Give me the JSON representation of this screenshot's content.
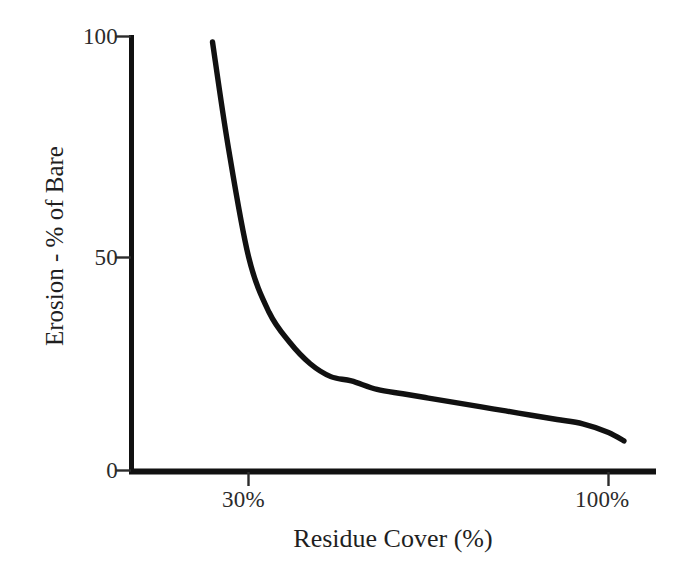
{
  "chart_data": {
    "type": "line",
    "title": "",
    "xlabel": "Residue Cover (%)",
    "ylabel": "Erosion - % of Bare",
    "xlim": [
      20,
      108
    ],
    "ylim": [
      0,
      100
    ],
    "grid": false,
    "legend": null,
    "x_tick_labels": [
      "30%",
      "100%"
    ],
    "x_tick_values": [
      30,
      100
    ],
    "y_tick_labels": [
      "0",
      "50",
      "100"
    ],
    "y_tick_values": [
      0,
      50,
      100
    ],
    "series": [
      {
        "name": "Erosion vs Residue Cover",
        "color": "#111111",
        "x": [
          23,
          26,
          30,
          34,
          38,
          42,
          46,
          50,
          55,
          60,
          65,
          70,
          75,
          80,
          85,
          90,
          95,
          100,
          103
        ],
        "values": [
          100,
          76,
          50,
          37,
          30,
          25,
          22,
          21,
          19,
          18,
          17,
          16,
          15,
          14,
          13,
          12,
          11,
          9,
          7
        ]
      }
    ],
    "curve_points": [
      {
        "x": 23,
        "y": 100
      },
      {
        "x": 26,
        "y": 76
      },
      {
        "x": 30,
        "y": 50
      },
      {
        "x": 34,
        "y": 37
      },
      {
        "x": 38,
        "y": 30
      },
      {
        "x": 42,
        "y": 25
      },
      {
        "x": 46,
        "y": 22
      },
      {
        "x": 50,
        "y": 21
      },
      {
        "x": 55,
        "y": 19
      },
      {
        "x": 60,
        "y": 18
      },
      {
        "x": 65,
        "y": 17
      },
      {
        "x": 70,
        "y": 16
      },
      {
        "x": 75,
        "y": 15
      },
      {
        "x": 80,
        "y": 14
      },
      {
        "x": 85,
        "y": 13
      },
      {
        "x": 90,
        "y": 12
      },
      {
        "x": 95,
        "y": 11
      },
      {
        "x": 100,
        "y": 9
      },
      {
        "x": 103,
        "y": 7
      }
    ]
  },
  "axes": {
    "y_ticks": [
      {
        "label": "100"
      },
      {
        "label": "50"
      },
      {
        "label": "0"
      }
    ],
    "x_ticks": [
      {
        "label": "30%"
      },
      {
        "label": "100%"
      }
    ],
    "y_title": "Erosion - % of Bare",
    "x_title": "Residue Cover (%)"
  },
  "style": {
    "background": "#ffffff",
    "axis_color": "#111111",
    "curve_color": "#111111",
    "text_color": "#1f1f1f"
  }
}
